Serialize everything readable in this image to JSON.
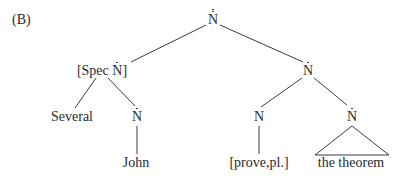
{
  "figure": {
    "label": "(B)"
  },
  "tree": {
    "root": {
      "category": "N",
      "bars": 2
    },
    "spec": {
      "prefix": "[Spec ",
      "category": "N",
      "suffix": "]",
      "bars": 1
    },
    "right_nbar": {
      "category": "N",
      "bars": 1
    },
    "several": {
      "text": "Several"
    },
    "left_nbar": {
      "category": "N",
      "bars": 1
    },
    "n_head": {
      "category": "N",
      "bars": 0
    },
    "obj_nbar": {
      "category": "N",
      "bars": 1
    },
    "john": {
      "text": "John"
    },
    "prove": {
      "text": "[prove,pl.]"
    },
    "theorem": {
      "text": "the theorem"
    }
  }
}
